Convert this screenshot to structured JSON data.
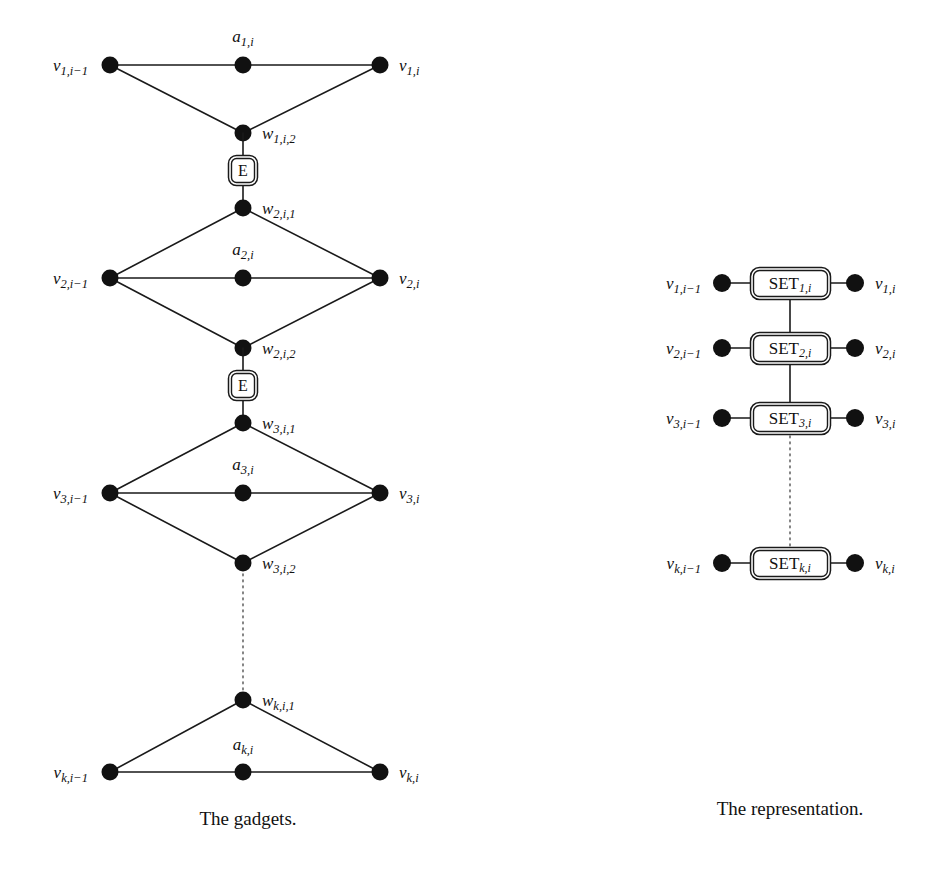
{
  "figure": {
    "background_color": "#ffffff",
    "ink_color": "#111111",
    "dotted_color": "#6f6f6f",
    "width": 943,
    "height": 873
  },
  "captions": {
    "left": "The gadgets.",
    "right": "The representation."
  },
  "gadgets_panel": {
    "title": "The gadgets.",
    "node_radius": 8,
    "columns": {
      "left_x": 110,
      "center_x": 243,
      "right_x": 380
    },
    "gadgets": [
      {
        "id": "gadget-1",
        "shape": "triangle-down",
        "row_y": 65,
        "apex_y": 133,
        "left_label": "v",
        "left_sub": "1,i−1",
        "right_label": "v",
        "right_sub": "1,i",
        "center_label": "a",
        "center_sub": "1,i",
        "center_label_y": 42,
        "apex_label": "w",
        "apex_sub": "1,i,2",
        "apex_side": "right"
      },
      {
        "id": "gadget-2",
        "shape": "diamond",
        "top_y": 208,
        "row_y": 278,
        "bottom_y": 348,
        "left_label": "v",
        "left_sub": "2,i−1",
        "right_label": "v",
        "right_sub": "2,i",
        "center_label": "a",
        "center_sub": "2,i",
        "center_label_y": 255,
        "top_node_label": "w",
        "top_node_sub": "2,i,1",
        "bottom_node_label": "w",
        "bottom_node_sub": "2,i,2"
      },
      {
        "id": "gadget-3",
        "shape": "diamond",
        "top_y": 423,
        "row_y": 493,
        "bottom_y": 563,
        "left_label": "v",
        "left_sub": "3,i−1",
        "right_label": "v",
        "right_sub": "3,i",
        "center_label": "a",
        "center_sub": "3,i",
        "center_label_y": 470,
        "top_node_label": "w",
        "top_node_sub": "3,i,1",
        "bottom_node_label": "w",
        "bottom_node_sub": "3,i,2"
      },
      {
        "id": "gadget-k",
        "shape": "triangle-up",
        "apex_y": 700,
        "row_y": 772,
        "left_label": "v",
        "left_sub": "k,i−1",
        "right_label": "v",
        "right_sub": "k,i",
        "center_label": "a",
        "center_sub": "k,i",
        "center_label_y": 750,
        "apex_label": "w",
        "apex_sub": "k,i,1",
        "apex_side": "right"
      }
    ],
    "connectors": [
      {
        "id": "e-box-1",
        "label": "E",
        "x": 243,
        "from_y": 133,
        "to_y": 208,
        "type": "double-rounded-box"
      },
      {
        "id": "e-box-2",
        "label": "E",
        "x": 243,
        "from_y": 348,
        "to_y": 423,
        "type": "double-rounded-box"
      }
    ],
    "dotted_connector": {
      "id": "gadget-ellipsis",
      "x": 243,
      "from_y": 563,
      "to_y": 700
    }
  },
  "representation_panel": {
    "title": "The representation.",
    "node_radius": 9,
    "left_node_x": 722,
    "right_node_x": 855,
    "box_center_x": 790,
    "box_width": 80,
    "box_height": 32,
    "rows": [
      {
        "id": "set-row-1",
        "y": 283,
        "left_label": "v",
        "left_sub": "1,i−1",
        "right_label": "v",
        "right_sub": "1,i",
        "box_label": "SET",
        "box_sub": "1,i"
      },
      {
        "id": "set-row-2",
        "y": 348,
        "left_label": "v",
        "left_sub": "2,i−1",
        "right_label": "v",
        "right_sub": "2,i",
        "box_label": "SET",
        "box_sub": "2,i"
      },
      {
        "id": "set-row-3",
        "y": 418,
        "left_label": "v",
        "left_sub": "3,i−1",
        "right_label": "v",
        "right_sub": "3,i",
        "box_label": "SET",
        "box_sub": "3,i"
      },
      {
        "id": "set-row-k",
        "y": 563,
        "left_label": "v",
        "left_sub": "k,i−1",
        "right_label": "v",
        "right_sub": "k,i",
        "box_label": "SET",
        "box_sub": "k,i"
      }
    ],
    "vertical_links": [
      {
        "id": "set-link-1-2",
        "from_y": 299,
        "to_y": 332,
        "style": "solid"
      },
      {
        "id": "set-link-2-3",
        "from_y": 364,
        "to_y": 402,
        "style": "solid"
      },
      {
        "id": "set-link-3-k",
        "from_y": 434,
        "to_y": 547,
        "style": "dotted"
      }
    ]
  }
}
